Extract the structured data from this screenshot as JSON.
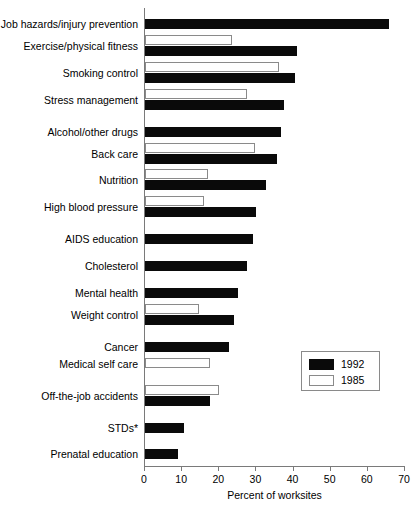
{
  "chart_data": {
    "type": "bar",
    "orientation": "horizontal",
    "title": "",
    "xlabel": "Percent of worksites",
    "ylabel": "",
    "xlim": [
      0,
      70
    ],
    "xticks": [
      0,
      10,
      20,
      30,
      40,
      50,
      60,
      70
    ],
    "grid": false,
    "legend_position": "middle-right",
    "categories": [
      "Job hazards/injury prevention",
      "Exercise/physical fitness",
      "Smoking control",
      "Stress management",
      "Alcohol/other drugs",
      "Back care",
      "Nutrition",
      "High blood pressure",
      "AIDS education",
      "Cholesterol",
      "Mental health",
      "Weight control",
      "Cancer",
      "Medical self care",
      "Off-the-job accidents",
      "STDs*",
      "Prenatal education"
    ],
    "series": [
      {
        "name": "1992",
        "color": "#0a0a0a",
        "values": [
          65.7,
          41.0,
          40.5,
          37.5,
          36.5,
          35.5,
          32.5,
          30.0,
          29.0,
          27.5,
          25.0,
          24.0,
          22.5,
          null,
          17.5,
          10.5,
          9.0
        ]
      },
      {
        "name": "1985",
        "color": "#ffffff",
        "values": [
          null,
          23.5,
          36.0,
          27.5,
          null,
          29.5,
          17.0,
          16.0,
          null,
          null,
          null,
          14.5,
          null,
          17.5,
          20.0,
          null,
          null
        ]
      }
    ]
  },
  "legend": {
    "entries": [
      {
        "label": "1992",
        "swatch": "black"
      },
      {
        "label": "1985",
        "swatch": "white"
      }
    ]
  },
  "axis": {
    "x_title": "Percent of worksites",
    "tick_labels": [
      "0",
      "10",
      "20",
      "30",
      "40",
      "50",
      "60",
      "70"
    ]
  }
}
